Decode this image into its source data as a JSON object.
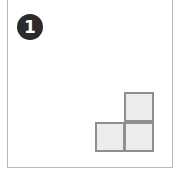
{
  "panel": {
    "label": "1",
    "badge_color": "#2b2b2b",
    "border_color": "#b8b8b8"
  },
  "shape": {
    "type": "L-tromino",
    "fill": "#ececec",
    "stroke": "#8f8f8f",
    "cells": [
      {
        "row": 0,
        "col": 1
      },
      {
        "row": 1,
        "col": 0
      },
      {
        "row": 1,
        "col": 1
      }
    ]
  }
}
